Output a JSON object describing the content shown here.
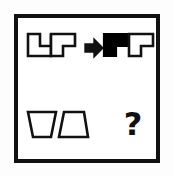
{
  "puzzle": {
    "type": "visual-analogy",
    "frame": {
      "border_color": "#111111",
      "background_color": "#ffffff"
    },
    "colors": {
      "ink": "#111111",
      "fill_black": "#000000",
      "fill_white": "#ffffff",
      "page_background": "#fdfdfd"
    },
    "top_row": {
      "label": "example-row",
      "source_group": {
        "label": "outlined-shape-pair",
        "shapes": [
          {
            "name": "u-polyomino",
            "glyph": "⊔",
            "fill": "#ffffff",
            "stroke": "#111111"
          },
          {
            "name": "gamma-polyomino",
            "glyph": "Γ",
            "fill": "#ffffff",
            "stroke": "#111111"
          }
        ]
      },
      "operator": {
        "name": "right-arrow",
        "glyph": "➡",
        "color": "#111111"
      },
      "result_group": {
        "label": "transformed-shape-pair",
        "shapes": [
          {
            "name": "l-polyomino-filled",
            "glyph": "L",
            "fill": "#000000",
            "stroke": "#000000"
          },
          {
            "name": "gamma-polyomino",
            "glyph": "Γ",
            "fill": "#ffffff",
            "stroke": "#111111"
          }
        ]
      }
    },
    "bottom_row": {
      "label": "question-row",
      "source_group": {
        "label": "trapezoid-pair",
        "shapes": [
          {
            "name": "trapezoid-narrow-bottom",
            "fill": "#ffffff",
            "stroke": "#111111"
          },
          {
            "name": "trapezoid-narrow-top",
            "fill": "#ffffff",
            "stroke": "#111111"
          }
        ]
      },
      "answer_placeholder": {
        "name": "question-mark",
        "text": "?",
        "color": "#111111"
      }
    }
  }
}
